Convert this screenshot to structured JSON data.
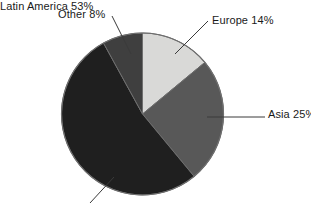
{
  "chart_data": {
    "type": "pie",
    "title": "",
    "subtitle": "",
    "xlabel": "",
    "ylabel": "",
    "legend_position": "none",
    "grid": false,
    "labels_on_slices": false,
    "start_angle_deg": 0,
    "direction": "clockwise",
    "categories": [
      "Europe",
      "Asia",
      "Latin America",
      "Other"
    ],
    "values": [
      14,
      25,
      53,
      8
    ],
    "unit": "%",
    "slices": [
      {
        "name": "Europe",
        "value": 14,
        "label": "Europe 14%",
        "color": "#d9d9d7",
        "start_deg": 0.0,
        "end_deg": 50.4
      },
      {
        "name": "Asia",
        "value": 25,
        "label": "Asia 25%",
        "color": "#585858",
        "start_deg": 50.4,
        "end_deg": 140.4
      },
      {
        "name": "Latin America",
        "value": 53,
        "label": "Latin America 53%",
        "color": "#1f1f1f",
        "start_deg": 140.4,
        "end_deg": 331.2
      },
      {
        "name": "Other",
        "value": 8,
        "label": "Other 8%",
        "color": "#3f3f3f",
        "start_deg": 331.2,
        "end_deg": 360.0
      }
    ]
  },
  "chart": {
    "labels": {
      "other": "Other 8%",
      "europe": "Europe 14%",
      "asia": "Asia 25%",
      "latin_america": "Latin America 53%"
    },
    "colors": {
      "europe": "#d9d9d7",
      "asia": "#585858",
      "latin_america": "#1f1f1f",
      "other": "#3f3f3f",
      "outline": "#6e6e6e",
      "leader_line": "#3a3a3a",
      "text": "#1a1a1a",
      "background": "#ffffff"
    }
  }
}
